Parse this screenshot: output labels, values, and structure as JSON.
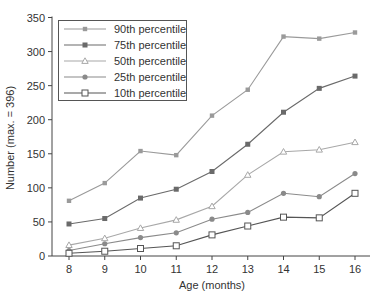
{
  "chart_data": {
    "type": "line",
    "title": "",
    "xlabel": "Age (months)",
    "ylabel": "Number (max. = 396)",
    "x": [
      8,
      9,
      10,
      11,
      12,
      13,
      14,
      15,
      16
    ],
    "xlim": [
      8,
      16
    ],
    "ylim": [
      0,
      350
    ],
    "yticks": [
      0,
      50,
      100,
      150,
      200,
      250,
      300,
      350
    ],
    "xticks": [
      8,
      9,
      10,
      11,
      12,
      13,
      14,
      15,
      16
    ],
    "grid": false,
    "legend_position": "upper-left",
    "series": [
      {
        "name": "90th percentile",
        "marker": "filled-square-small",
        "color": "#9a9a9a",
        "values": [
          81,
          107,
          154,
          148,
          206,
          244,
          322,
          319,
          328
        ]
      },
      {
        "name": "75th percentile",
        "marker": "filled-square",
        "color": "#6a6a6a",
        "values": [
          47,
          55,
          85,
          98,
          124,
          164,
          211,
          246,
          264
        ]
      },
      {
        "name": "50th percentile",
        "marker": "open-triangle",
        "color": "#a8a8a8",
        "values": [
          16,
          26,
          41,
          53,
          73,
          119,
          153,
          156,
          167
        ]
      },
      {
        "name": "25th percentile",
        "marker": "filled-circle",
        "color": "#8a8a8a",
        "values": [
          8,
          18,
          27,
          34,
          54,
          64,
          92,
          87,
          121
        ]
      },
      {
        "name": "10th percentile",
        "marker": "open-square",
        "color": "#555555",
        "values": [
          4,
          7,
          11,
          15,
          31,
          44,
          57,
          56,
          92
        ]
      }
    ]
  }
}
